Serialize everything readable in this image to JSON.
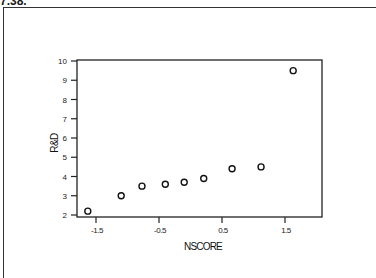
{
  "exercise_label": "7.38.",
  "chart_data": {
    "type": "scatter",
    "title": "",
    "xlabel": "NSCORE",
    "ylabel": "R&D",
    "xlim": [
      -1.8,
      1.85
    ],
    "ylim": [
      1.8,
      10.1
    ],
    "x_ticks": [
      -1.5,
      -0.5,
      0.5,
      1.5
    ],
    "x_tick_labels": [
      "-1.5",
      "-0.5",
      "0.5",
      "1.5"
    ],
    "y_ticks": [
      2,
      3,
      4,
      5,
      6,
      7,
      8,
      9,
      10
    ],
    "y_tick_labels": [
      "2",
      "3",
      "4",
      "5",
      "6",
      "7",
      "8",
      "9",
      "10"
    ],
    "grid": false,
    "legend": null,
    "marker": "open-circle",
    "series": [
      {
        "name": "R&D vs NSCORE",
        "x": [
          -1.63,
          -1.1,
          -0.77,
          -0.4,
          -0.1,
          0.21,
          0.66,
          1.12,
          1.63
        ],
        "y": [
          2.2,
          3.0,
          3.5,
          3.6,
          3.7,
          3.9,
          4.4,
          4.5,
          9.5
        ]
      }
    ]
  }
}
